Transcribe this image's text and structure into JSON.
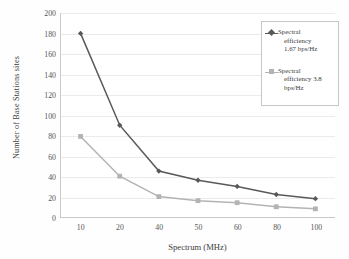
{
  "chart_data": {
    "type": "line",
    "title": "",
    "xlabel": "Spectrum (MHz)",
    "ylabel": "Number of Base Stations sites",
    "categories": [
      "10",
      "20",
      "40",
      "50",
      "60",
      "80",
      "100"
    ],
    "ylim": [
      0,
      200
    ],
    "ytick_step": 20,
    "yticks": [
      "0",
      "20",
      "40",
      "60",
      "80",
      "100",
      "120",
      "140",
      "160",
      "180",
      "200"
    ],
    "grid": "horizontal",
    "legend_position": "top-right",
    "series": [
      {
        "name": "Spectral efficiency 1.67 bps/Hz",
        "color": "#595959",
        "marker": "diamond",
        "values": [
          180,
          90,
          45,
          36,
          30,
          22,
          18
        ]
      },
      {
        "name": "Spectral efficiency 3.8 bps/Hz",
        "color": "#b3b3b3",
        "marker": "square",
        "values": [
          79,
          40,
          20,
          16,
          14,
          10,
          8
        ]
      }
    ]
  },
  "axes": {
    "y_title": "Number of Base Stations sites",
    "x_title": "Spectrum (MHz)"
  },
  "legend": {
    "entries": [
      {
        "line1": "Spectral",
        "line2": "efficiency",
        "line3": "1.67 bps/Hz",
        "marker": "diamond-marker",
        "color": "#595959"
      },
      {
        "line1": "Spectral",
        "line2": "efficiency 3.8",
        "line3": "bps/Hz",
        "marker": "square-marker",
        "color": "#b3b3b3"
      }
    ]
  }
}
